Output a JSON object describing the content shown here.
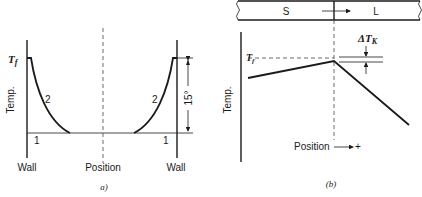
{
  "panel_a": {
    "y_label": "Temp.",
    "tf_label": "T",
    "tf_sub": "f",
    "curve_label_left": "2",
    "curve_label_right": "2",
    "base_label_left": "1",
    "base_label_right": "1",
    "dimension_label": "15°",
    "wall_left": "Wall",
    "wall_right": "Wall",
    "x_label": "Position",
    "caption": "a)"
  },
  "panel_b": {
    "solid_label": "S",
    "liquid_label": "L",
    "y_label": "Temp.",
    "tf_label": "T",
    "tf_sub": "f",
    "delta_label": "ΔT",
    "delta_sub": "K",
    "x_label": "Position",
    "x_dir": "+",
    "caption": "(b)"
  },
  "colors": {
    "ink": "#1a1a1a",
    "background": "#ffffff"
  }
}
